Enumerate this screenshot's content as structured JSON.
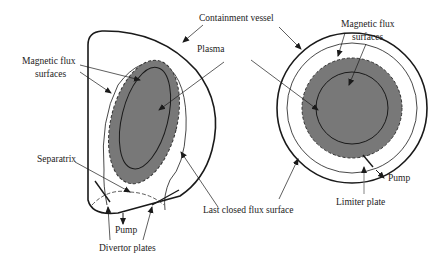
{
  "colors": {
    "plasma_fill": "#787878",
    "line": "#1a1a1a",
    "background": "#ffffff"
  },
  "left_diagram": {
    "label_containment_vessel": "Containment vessel",
    "label_plasma": "Plasma",
    "label_flux_line1": "Magnetic flux",
    "label_flux_line2": "surfaces",
    "label_separatrix": "Separatrix",
    "label_pump": "Pump",
    "label_divertor": "Divertor plates",
    "label_last_closed": "Last closed flux surface"
  },
  "right_diagram": {
    "label_flux_line1": "Magnetic flux",
    "label_flux_line2": "surfaces",
    "label_pump": "Pump",
    "label_limiter": "Limiter plate"
  }
}
